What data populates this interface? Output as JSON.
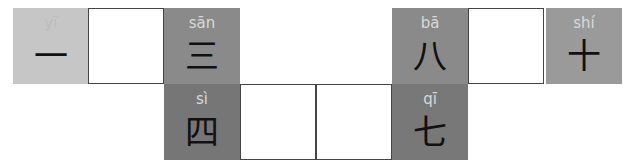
{
  "puzzle": {
    "cells": [
      {
        "id": "yi",
        "pinyin": "yī",
        "hanzi": "一",
        "x": 13,
        "y": 8,
        "bg": "#c6c6c6",
        "type": "filled"
      },
      {
        "id": "blank-2",
        "x": 88,
        "y": 8,
        "type": "blank"
      },
      {
        "id": "san",
        "pinyin": "sān",
        "hanzi": "三",
        "x": 164,
        "y": 8,
        "bg": "#8a8a8a",
        "type": "filled"
      },
      {
        "id": "ba",
        "pinyin": "bā",
        "hanzi": "八",
        "x": 392,
        "y": 8,
        "bg": "#8a8a8a",
        "type": "filled"
      },
      {
        "id": "blank-9",
        "x": 468,
        "y": 8,
        "type": "blank"
      },
      {
        "id": "shi",
        "pinyin": "shí",
        "hanzi": "十",
        "x": 546,
        "y": 8,
        "bg": "#9a9a9a",
        "type": "filled"
      },
      {
        "id": "si",
        "pinyin": "sì",
        "hanzi": "四",
        "x": 164,
        "y": 84,
        "bg": "#767676",
        "type": "filled"
      },
      {
        "id": "blank-5",
        "x": 240,
        "y": 84,
        "type": "blank"
      },
      {
        "id": "blank-6",
        "x": 316,
        "y": 84,
        "type": "blank"
      },
      {
        "id": "qi",
        "pinyin": "qī",
        "hanzi": "七",
        "x": 392,
        "y": 84,
        "bg": "#787878",
        "type": "filled"
      }
    ]
  }
}
